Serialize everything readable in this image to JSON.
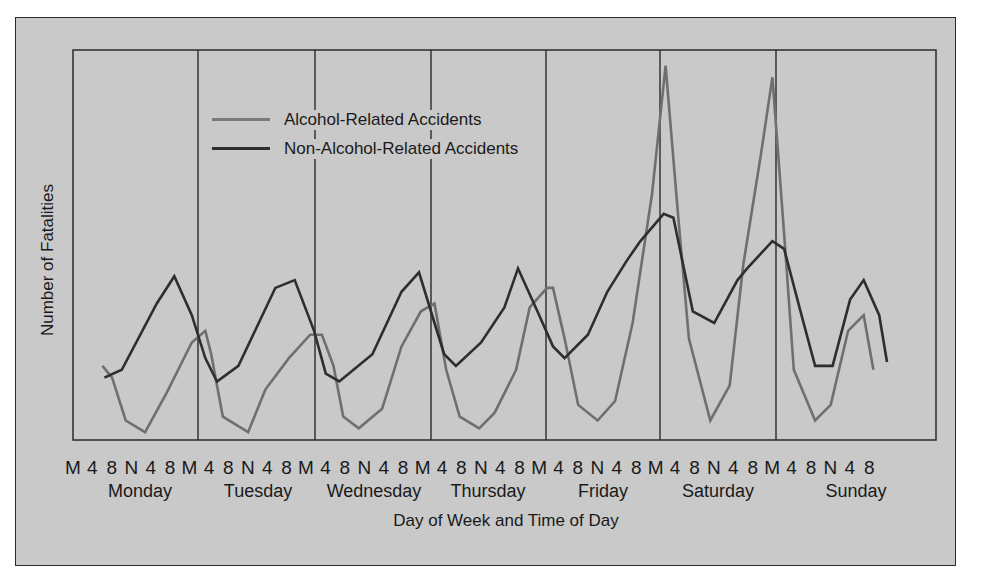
{
  "chart_data": {
    "type": "line",
    "title": "",
    "xlabel": "Day of Week and Time of Day",
    "ylabel": "Number of Fatalities",
    "ylim": [
      0,
      100
    ],
    "y_units": "relative (no numeric y-axis ticks shown)",
    "grid": "vertical day separators only",
    "legend_position": "upper-left inside plot",
    "days": [
      "Monday",
      "Tuesday",
      "Wednesday",
      "Thursday",
      "Friday",
      "Saturday",
      "Sunday"
    ],
    "tick_labels": [
      "M",
      "4",
      "8",
      "N",
      "4",
      "8",
      "M",
      "4",
      "8",
      "N",
      "4",
      "8",
      "M",
      "4",
      "8",
      "N",
      "4",
      "8",
      "M",
      "4",
      "8",
      "N",
      "4",
      "8",
      "M",
      "4",
      "8",
      "N",
      "4",
      "8",
      "M",
      "4",
      "8",
      "N",
      "4",
      "8",
      "M",
      "4",
      "8",
      "N",
      "4",
      "8"
    ],
    "x_slot_unit": "4-hour slot index from Monday midnight (0) to Sunday 8pm (41)",
    "series": [
      {
        "name": "Alcohol-Related Accidents",
        "color": "#6f6f6f",
        "points": [
          [
            1.0,
            19
          ],
          [
            1.5,
            16
          ],
          [
            2.2,
            5
          ],
          [
            3.2,
            2
          ],
          [
            4.3,
            12
          ],
          [
            5.6,
            25
          ],
          [
            6.3,
            28
          ],
          [
            6.6,
            22
          ],
          [
            7.2,
            6
          ],
          [
            8.5,
            2
          ],
          [
            9.4,
            13
          ],
          [
            10.6,
            21
          ],
          [
            11.7,
            27
          ],
          [
            12.3,
            27
          ],
          [
            12.9,
            19
          ],
          [
            13.4,
            6
          ],
          [
            14.2,
            3
          ],
          [
            15.4,
            8
          ],
          [
            16.4,
            24
          ],
          [
            17.4,
            33
          ],
          [
            18.1,
            35
          ],
          [
            18.7,
            18
          ],
          [
            19.4,
            6
          ],
          [
            20.4,
            3
          ],
          [
            21.2,
            7
          ],
          [
            22.3,
            18
          ],
          [
            23.0,
            34
          ],
          [
            23.9,
            39
          ],
          [
            24.2,
            39
          ],
          [
            24.8,
            26
          ],
          [
            25.5,
            9
          ],
          [
            26.5,
            5
          ],
          [
            27.4,
            10
          ],
          [
            28.3,
            30
          ],
          [
            29.3,
            63
          ],
          [
            30.0,
            96
          ],
          [
            30.6,
            60
          ],
          [
            31.2,
            26
          ],
          [
            32.3,
            5
          ],
          [
            33.3,
            14
          ],
          [
            34.0,
            45
          ],
          [
            34.9,
            73
          ],
          [
            35.5,
            93
          ],
          [
            36.1,
            53
          ],
          [
            36.6,
            18
          ],
          [
            37.7,
            5
          ],
          [
            38.5,
            9
          ],
          [
            39.4,
            28
          ],
          [
            40.2,
            32
          ],
          [
            40.7,
            18
          ]
        ]
      },
      {
        "name": "Non-Alcohol-Related Accidents",
        "color": "#2e2e2e",
        "points": [
          [
            1.1,
            16
          ],
          [
            2.0,
            18
          ],
          [
            3.8,
            35
          ],
          [
            4.7,
            42
          ],
          [
            5.6,
            32
          ],
          [
            6.3,
            21
          ],
          [
            6.9,
            15
          ],
          [
            8.0,
            19
          ],
          [
            9.9,
            39
          ],
          [
            10.9,
            41
          ],
          [
            11.9,
            28
          ],
          [
            12.5,
            17
          ],
          [
            13.2,
            15
          ],
          [
            14.9,
            22
          ],
          [
            16.4,
            38
          ],
          [
            17.3,
            43
          ],
          [
            18.1,
            30
          ],
          [
            18.6,
            22
          ],
          [
            19.2,
            19
          ],
          [
            20.5,
            25
          ],
          [
            21.7,
            34
          ],
          [
            22.4,
            44
          ],
          [
            23.4,
            33
          ],
          [
            24.2,
            24
          ],
          [
            24.8,
            21
          ],
          [
            26.0,
            27
          ],
          [
            27.0,
            38
          ],
          [
            28.0,
            46
          ],
          [
            28.7,
            51
          ],
          [
            29.9,
            58
          ],
          [
            30.4,
            57
          ],
          [
            31.4,
            33
          ],
          [
            32.5,
            30
          ],
          [
            33.7,
            41
          ],
          [
            34.2,
            44
          ],
          [
            35.5,
            51
          ],
          [
            36.1,
            49
          ],
          [
            37.0,
            32
          ],
          [
            37.7,
            19
          ],
          [
            38.6,
            19
          ],
          [
            39.5,
            36
          ],
          [
            40.2,
            41
          ],
          [
            41.0,
            32
          ],
          [
            41.4,
            20
          ]
        ]
      }
    ]
  },
  "legend": {
    "items": [
      {
        "label": "Alcohol-Related Accidents",
        "color": "#6f6f6f"
      },
      {
        "label": "Non-Alcohol-Related Accidents",
        "color": "#2e2e2e"
      }
    ]
  },
  "axes": {
    "ylabel": "Number of Fatalities",
    "xlabel": "Day of Week and Time of Day"
  },
  "colors": {
    "background": "#c9c9c9",
    "frame": "#2a2a2a",
    "alcohol_line": "#6f6f6f",
    "non_alcohol_line": "#2e2e2e"
  }
}
